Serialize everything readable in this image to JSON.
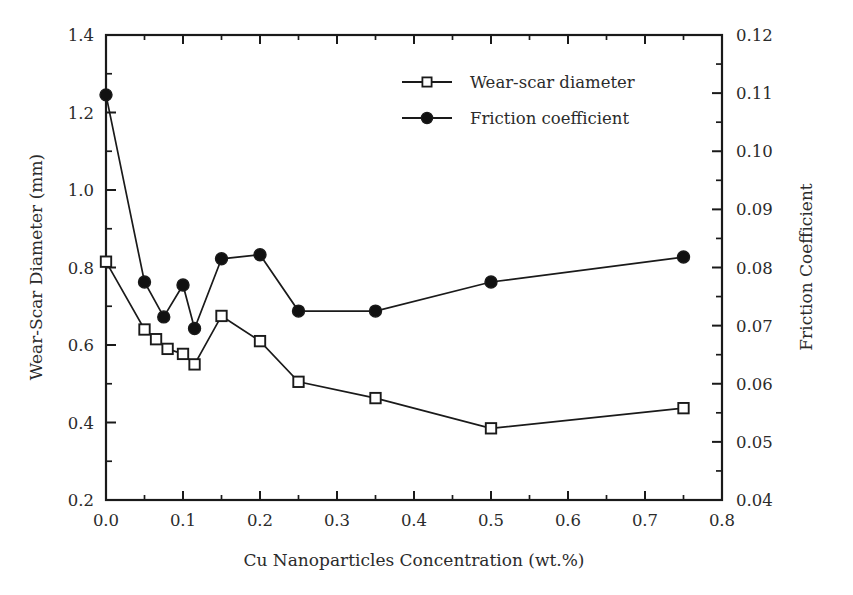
{
  "chart_data": {
    "type": "line",
    "title": "",
    "xlabel": "Cu Nanoparticles Concentration (wt.%)",
    "ylabel": "Wear-Scar Diameter (mm)",
    "y2label": "Friction Coefficient",
    "xlim": [
      0.0,
      0.8
    ],
    "ylim": [
      0.2,
      1.4
    ],
    "y2lim": [
      0.04,
      0.12
    ],
    "xticks": [
      "0.0",
      "0.1",
      "0.2",
      "0.3",
      "0.4",
      "0.5",
      "0.6",
      "0.7",
      "0.8"
    ],
    "xtick_values": [
      0.0,
      0.1,
      0.2,
      0.3,
      0.4,
      0.5,
      0.6,
      0.7,
      0.8
    ],
    "yticks": [
      "0.2",
      "0.4",
      "0.6",
      "0.8",
      "1.0",
      "1.2",
      "1.4"
    ],
    "ytick_values": [
      0.2,
      0.4,
      0.6,
      0.8,
      1.0,
      1.2,
      1.4
    ],
    "y2ticks": [
      "0.04",
      "0.05",
      "0.06",
      "0.07",
      "0.08",
      "0.09",
      "0.10",
      "0.11",
      "0.12"
    ],
    "y2tick_values": [
      0.04,
      0.05,
      0.06,
      0.07,
      0.08,
      0.09,
      0.1,
      0.11,
      0.12
    ],
    "grid": false,
    "minor_ticks": true,
    "legend_position": "top-center-right",
    "line_color": "#1a1a1a",
    "marker_fill_open": "#ffffff",
    "marker_fill_closed": "#111111",
    "series": [
      {
        "name": "Wear-scar diameter",
        "axis": "left",
        "marker": "open-square",
        "x": [
          0.0,
          0.05,
          0.065,
          0.08,
          0.1,
          0.115,
          0.15,
          0.2,
          0.25,
          0.35,
          0.5,
          0.75
        ],
        "values": [
          0.815,
          0.64,
          0.615,
          0.59,
          0.577,
          0.55,
          0.675,
          0.61,
          0.505,
          0.463,
          0.385,
          0.437
        ]
      },
      {
        "name": "Friction coefficient",
        "axis": "right",
        "marker": "filled-circle",
        "x": [
          0.0,
          0.05,
          0.075,
          0.1,
          0.115,
          0.15,
          0.2,
          0.25,
          0.35,
          0.5,
          0.75
        ],
        "values": [
          0.1097,
          0.0775,
          0.0715,
          0.077,
          0.0695,
          0.0815,
          0.0822,
          0.0725,
          0.0725,
          0.0775,
          0.0818
        ]
      }
    ]
  },
  "legend": {
    "items": [
      {
        "label": "Wear-scar diameter",
        "marker": "open-square"
      },
      {
        "label": "Friction coefficient",
        "marker": "filled-circle"
      }
    ]
  }
}
